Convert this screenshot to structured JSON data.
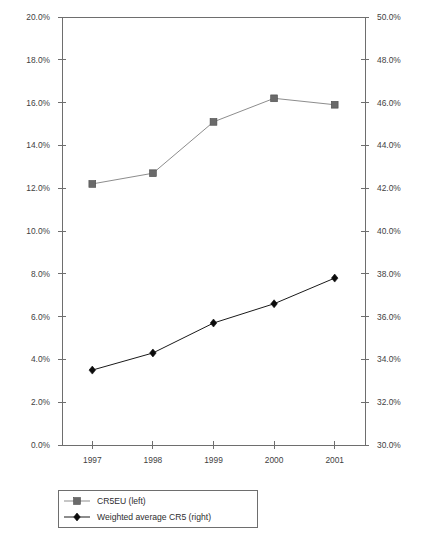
{
  "chart_data": {
    "type": "line",
    "title": "",
    "subtitle": "",
    "xlabel": "",
    "ylabel": "",
    "categories": [
      "1997",
      "1998",
      "1999",
      "2000",
      "2001"
    ],
    "grid": false,
    "legend_position": "bottom-left",
    "axes": {
      "left": {
        "label": "",
        "ylim": [
          0.0,
          20.0
        ],
        "tick_step": 2.0,
        "ticks": [
          0.0,
          2.0,
          4.0,
          6.0,
          8.0,
          10.0,
          12.0,
          14.0,
          16.0,
          18.0,
          20.0
        ],
        "tick_labels": [
          "0.0%",
          "2.0%",
          "4.0%",
          "6.0%",
          "8.0%",
          "10.0%",
          "12.0%",
          "14.0%",
          "16.0%",
          "18.0%",
          "20.0%"
        ]
      },
      "right": {
        "label": "",
        "ylim": [
          30.0,
          50.0
        ],
        "tick_step": 2.0,
        "ticks": [
          30.0,
          32.0,
          34.0,
          36.0,
          38.0,
          40.0,
          42.0,
          44.0,
          46.0,
          48.0,
          50.0
        ],
        "tick_labels": [
          "30.0%",
          "32.0%",
          "34.0%",
          "36.0%",
          "38.0%",
          "40.0%",
          "42.0%",
          "44.0%",
          "46.0%",
          "48.0%",
          "50.0%"
        ]
      }
    },
    "series": [
      {
        "name": "CR5EU (left)",
        "axis": "left",
        "marker": "square",
        "color": "#6a6a6a",
        "line_color": "#8d8d8d",
        "values": [
          12.2,
          12.7,
          15.1,
          16.2,
          15.9
        ]
      },
      {
        "name": "Weighted average CR5 (right)",
        "axis": "right",
        "marker": "diamond",
        "color": "#0c0c0c",
        "line_color": "#1a1a1a",
        "values": [
          33.5,
          34.3,
          35.7,
          36.6,
          37.8
        ]
      }
    ]
  },
  "legend": {
    "items": [
      {
        "label": "CR5EU (left)",
        "marker": "square"
      },
      {
        "label": "Weighted average CR5 (right)",
        "marker": "diamond"
      }
    ]
  }
}
